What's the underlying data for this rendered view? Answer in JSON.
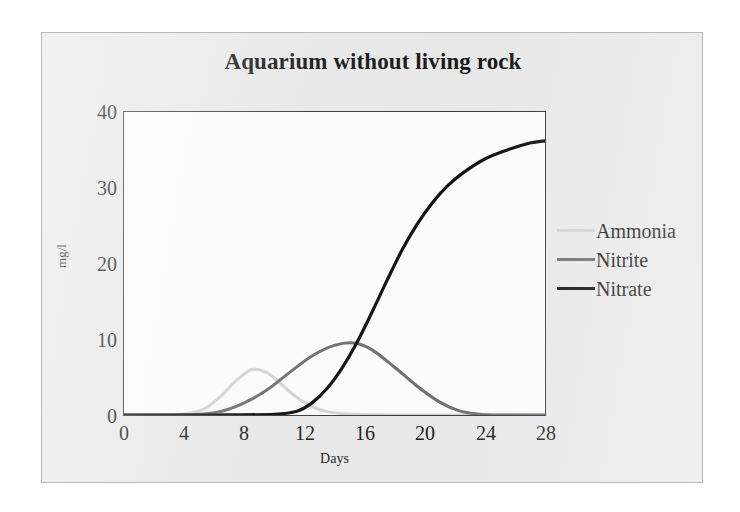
{
  "figure": {
    "background_color": "#e8e8e8",
    "plot_background_color": "#fbfbfb",
    "frame_color": "#3a3a3a"
  },
  "chart_data": {
    "type": "line",
    "title": "Aquarium without living rock",
    "xlabel": "Days",
    "ylabel": "mg/l",
    "xlim": [
      0,
      28
    ],
    "ylim": [
      0,
      40
    ],
    "xticks": [
      "0",
      "4",
      "8",
      "12",
      "16",
      "20",
      "24",
      "28"
    ],
    "yticks": [
      "0",
      "10",
      "20",
      "30",
      "40"
    ],
    "grid": false,
    "legend_position": "right",
    "series": [
      {
        "name": "Ammonia",
        "color": "#d2d2d2",
        "line_width": 3,
        "peak_day": 8.5,
        "peak_value": 6.0,
        "x": [
          0,
          2,
          3.5,
          4.5,
          5.5,
          6.5,
          7.5,
          8.5,
          9.5,
          10.5,
          11.5,
          12.5,
          13.5,
          15,
          17,
          19,
          22,
          25,
          28
        ],
        "values": [
          0,
          0,
          0.05,
          0.3,
          1.0,
          2.6,
          4.6,
          6.0,
          5.6,
          4.0,
          2.3,
          1.1,
          0.45,
          0.12,
          0.03,
          0,
          0,
          0,
          0
        ]
      },
      {
        "name": "Nitrite",
        "color": "#6f6f6f",
        "line_width": 3,
        "peak_day": 15.3,
        "peak_value": 9.5,
        "x": [
          0,
          3,
          5,
          6.5,
          8,
          9.5,
          11,
          12.5,
          14,
          15.3,
          16.5,
          18,
          19.5,
          21,
          22.3,
          23.5,
          25,
          28
        ],
        "values": [
          0,
          0,
          0.1,
          0.5,
          1.6,
          3.3,
          5.6,
          7.8,
          9.2,
          9.5,
          8.6,
          6.3,
          3.8,
          1.7,
          0.55,
          0.15,
          0,
          0
        ]
      },
      {
        "name": "Nitrate",
        "color": "#101010",
        "line_width": 3.2,
        "x": [
          0,
          6,
          10,
          11.5,
          12.5,
          13.5,
          14.5,
          15.5,
          16.5,
          17.5,
          18.5,
          19.5,
          20.5,
          21.5,
          22.5,
          24,
          25.5,
          27,
          28
        ],
        "values": [
          0,
          0,
          0.1,
          0.5,
          1.6,
          3.5,
          6.2,
          9.6,
          13.6,
          17.8,
          21.8,
          25.2,
          28.0,
          30.2,
          31.9,
          33.8,
          35.0,
          35.9,
          36.2
        ]
      }
    ]
  }
}
